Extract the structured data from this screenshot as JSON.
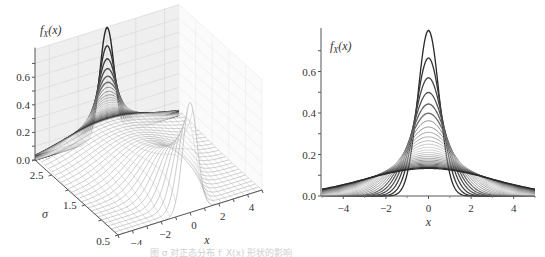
{
  "caption": "图 σ 对正态分布 f_X(x) 形状的影响",
  "chart_data": [
    {
      "type": "surface3d",
      "title": "",
      "function": "normal pdf f_X(x) with mean 0, standard deviation sigma",
      "zlabel": "f_X(x)",
      "xlabel": "x",
      "ylabel": "σ",
      "x_range": [
        -5,
        5
      ],
      "sigma_range": [
        0.5,
        3.0
      ],
      "z_range": [
        0,
        0.8
      ],
      "z_ticks": [
        0.0,
        0.2,
        0.4,
        0.6
      ],
      "z_tick_labels": [
        "0.0",
        "0.2",
        "0.4",
        "0.6"
      ],
      "x_ticks": [
        -4,
        -2,
        0,
        2,
        4
      ],
      "x_tick_labels": [
        "−4",
        "−2",
        "0",
        "2",
        "4"
      ],
      "sigma_ticks": [
        2.5,
        1.5,
        0.5
      ],
      "sigma_tick_labels": [
        "2.5",
        "1.5",
        "0.5"
      ],
      "sigma_values": [
        0.5,
        0.6,
        0.7,
        0.8,
        0.9,
        1.0,
        1.1,
        1.2,
        1.3,
        1.4,
        1.5,
        1.6,
        1.7,
        1.8,
        1.9,
        2.0,
        2.1,
        2.2,
        2.3,
        2.4,
        2.5,
        2.6,
        2.7,
        2.8,
        2.9,
        3.0
      ],
      "projection": "curves projected onto back wall (σ=3 plane), dark for small σ fading to grey",
      "peak_value": 0.798,
      "grid": true
    },
    {
      "type": "line",
      "title": "",
      "xlabel": "x",
      "ylabel": "f_X(x)",
      "xlim": [
        -5,
        5
      ],
      "ylim": [
        0,
        0.8
      ],
      "x_ticks": [
        -4,
        -2,
        0,
        2,
        4
      ],
      "x_tick_labels": [
        "−4",
        "−2",
        "0",
        "2",
        "4"
      ],
      "y_ticks": [
        0.0,
        0.2,
        0.4,
        0.6
      ],
      "y_tick_labels": [
        "0.0",
        "0.2",
        "0.4",
        "0.6"
      ],
      "series_description": "normal pdfs, mean 0, sigma from 0.5 (darkest, tallest, peak 0.798) through lighter grey to sigma 3.0 (dark, flattest, peak 0.133)",
      "sigma_values": [
        0.5,
        0.6,
        0.7,
        0.8,
        0.9,
        1.0,
        1.1,
        1.2,
        1.3,
        1.4,
        1.5,
        1.6,
        1.7,
        1.8,
        1.9,
        2.0,
        2.1,
        2.2,
        2.3,
        2.4,
        2.5,
        2.6,
        2.7,
        2.8,
        2.9,
        3.0
      ],
      "peaks": [
        0.798,
        0.665,
        0.57,
        0.499,
        0.443,
        0.399,
        0.363,
        0.332,
        0.307,
        0.285,
        0.266,
        0.249,
        0.235,
        0.222,
        0.21,
        0.199,
        0.19,
        0.181,
        0.173,
        0.166,
        0.16,
        0.153,
        0.148,
        0.142,
        0.138,
        0.133
      ],
      "grid": false,
      "legend": "none"
    }
  ],
  "left": {
    "zlabel": "f",
    "zlabel_sub": "X",
    "zlabel_tail": "(x)",
    "xlabel": "x",
    "sigmalabel": "σ"
  },
  "right": {
    "ylabel": "f",
    "ylabel_sub": "X",
    "ylabel_tail": "(x)",
    "xlabel": "x"
  }
}
